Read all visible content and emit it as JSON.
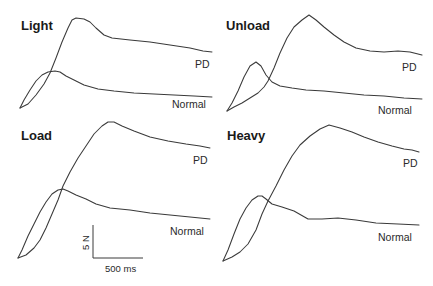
{
  "chart_data": {
    "type": "line",
    "title": "",
    "xlabel": "",
    "ylabel": "",
    "grid": false,
    "legend": "inline labels at the right end of each trace",
    "scale_bar": {
      "vertical_label": "5 N",
      "horizontal_label": "500 ms"
    },
    "panels": [
      {
        "title": "Light",
        "series": [
          {
            "name": "PD",
            "points": [
              [
                20,
                108
              ],
              [
                28,
                104
              ],
              [
                36,
                95
              ],
              [
                44,
                84
              ],
              [
                50,
                73
              ],
              [
                56,
                58
              ],
              [
                62,
                42
              ],
              [
                68,
                28
              ],
              [
                72,
                20
              ],
              [
                76,
                18
              ],
              [
                84,
                19
              ],
              [
                90,
                22
              ],
              [
                96,
                28
              ],
              [
                104,
                35
              ],
              [
                112,
                38
              ],
              [
                130,
                40
              ],
              [
                150,
                42
              ],
              [
                170,
                45
              ],
              [
                190,
                48
              ],
              [
                203,
                51
              ],
              [
                212,
                52
              ]
            ]
          },
          {
            "name": "Normal",
            "points": [
              [
                20,
                108
              ],
              [
                24,
                100
              ],
              [
                30,
                90
              ],
              [
                36,
                81
              ],
              [
                42,
                75
              ],
              [
                48,
                72
              ],
              [
                55,
                71
              ],
              [
                60,
                72
              ],
              [
                66,
                76
              ],
              [
                74,
                80
              ],
              [
                84,
                85
              ],
              [
                98,
                89
              ],
              [
                114,
                91
              ],
              [
                134,
                93
              ],
              [
                154,
                94
              ],
              [
                174,
                95
              ],
              [
                194,
                96
              ],
              [
                212,
                97
              ]
            ]
          }
        ],
        "labels": {
          "pd": "PD",
          "normal": "Normal"
        }
      },
      {
        "title": "Unload",
        "series": [
          {
            "name": "PD",
            "points": [
              [
                227,
                111
              ],
              [
                234,
                107
              ],
              [
                242,
                103
              ],
              [
                250,
                98
              ],
              [
                258,
                93
              ],
              [
                264,
                87
              ],
              [
                268,
                81
              ],
              [
                274,
                68
              ],
              [
                280,
                53
              ],
              [
                287,
                38
              ],
              [
                294,
                27
              ],
              [
                302,
                20
              ],
              [
                309,
                15
              ],
              [
                316,
                20
              ],
              [
                324,
                27
              ],
              [
                334,
                35
              ],
              [
                344,
                42
              ],
              [
                356,
                48
              ],
              [
                370,
                51
              ],
              [
                384,
                52
              ],
              [
                398,
                51
              ],
              [
                410,
                52
              ],
              [
                422,
                55
              ]
            ]
          },
          {
            "name": "Normal",
            "points": [
              [
                227,
                111
              ],
              [
                232,
                103
              ],
              [
                238,
                91
              ],
              [
                244,
                77
              ],
              [
                250,
                66
              ],
              [
                256,
                62
              ],
              [
                261,
                66
              ],
              [
                266,
                75
              ],
              [
                272,
                82
              ],
              [
                280,
                86
              ],
              [
                292,
                88
              ],
              [
                306,
                90
              ],
              [
                324,
                91
              ],
              [
                344,
                93
              ],
              [
                364,
                95
              ],
              [
                384,
                96
              ],
              [
                404,
                98
              ],
              [
                422,
                99
              ]
            ]
          }
        ],
        "labels": {
          "pd": "PD",
          "normal": "Normal"
        }
      },
      {
        "title": "Load",
        "series": [
          {
            "name": "PD",
            "points": [
              [
                18,
                258
              ],
              [
                26,
                255
              ],
              [
                34,
                248
              ],
              [
                40,
                240
              ],
              [
                46,
                228
              ],
              [
                52,
                214
              ],
              [
                58,
                200
              ],
              [
                63,
                186
              ],
              [
                70,
                172
              ],
              [
                78,
                158
              ],
              [
                86,
                146
              ],
              [
                94,
                134
              ],
              [
                102,
                126
              ],
              [
                108,
                122
              ],
              [
                114,
                122
              ],
              [
                122,
                126
              ],
              [
                134,
                131
              ],
              [
                150,
                137
              ],
              [
                168,
                141
              ],
              [
                186,
                144
              ],
              [
                200,
                146
              ],
              [
                210,
                148
              ]
            ]
          },
          {
            "name": "Normal",
            "points": [
              [
                18,
                258
              ],
              [
                22,
                250
              ],
              [
                28,
                236
              ],
              [
                34,
                224
              ],
              [
                40,
                212
              ],
              [
                46,
                202
              ],
              [
                52,
                194
              ],
              [
                58,
                190
              ],
              [
                63,
                189
              ],
              [
                68,
                191
              ],
              [
                76,
                195
              ],
              [
                86,
                199
              ],
              [
                96,
                204
              ],
              [
                110,
                208
              ],
              [
                130,
                210
              ],
              [
                150,
                213
              ],
              [
                170,
                215
              ],
              [
                190,
                217
              ],
              [
                210,
                219
              ]
            ]
          }
        ],
        "labels": {
          "pd": "PD",
          "normal": "Normal"
        }
      },
      {
        "title": "Heavy",
        "series": [
          {
            "name": "PD",
            "points": [
              [
                223,
                261
              ],
              [
                232,
                257
              ],
              [
                240,
                252
              ],
              [
                248,
                244
              ],
              [
                256,
                230
              ],
              [
                262,
                214
              ],
              [
                268,
                201
              ],
              [
                276,
                186
              ],
              [
                284,
                170
              ],
              [
                292,
                156
              ],
              [
                300,
                145
              ],
              [
                310,
                136
              ],
              [
                320,
                129
              ],
              [
                329,
                125
              ],
              [
                340,
                128
              ],
              [
                352,
                132
              ],
              [
                364,
                137
              ],
              [
                378,
                142
              ],
              [
                392,
                146
              ],
              [
                404,
                149
              ],
              [
                412,
                150
              ],
              [
                419,
                152
              ]
            ]
          },
          {
            "name": "Normal",
            "points": [
              [
                223,
                261
              ],
              [
                228,
                250
              ],
              [
                234,
                234
              ],
              [
                240,
                219
              ],
              [
                246,
                208
              ],
              [
                252,
                200
              ],
              [
                258,
                196
              ],
              [
                262,
                196
              ],
              [
                266,
                199
              ],
              [
                272,
                204
              ],
              [
                282,
                207
              ],
              [
                294,
                211
              ],
              [
                308,
                219
              ],
              [
                322,
                219
              ],
              [
                338,
                218
              ],
              [
                356,
                220
              ],
              [
                376,
                223
              ],
              [
                398,
                224
              ],
              [
                419,
                225
              ]
            ]
          }
        ],
        "labels": {
          "pd": "PD",
          "normal": "Normal"
        }
      }
    ]
  },
  "figure": {
    "panels": [
      {
        "title": "Light",
        "pd_label": "PD",
        "normal_label": "Normal"
      },
      {
        "title": "Unload",
        "pd_label": "PD",
        "normal_label": "Normal"
      },
      {
        "title": "Load",
        "pd_label": "PD",
        "normal_label": "Normal"
      },
      {
        "title": "Heavy",
        "pd_label": "PD",
        "normal_label": "Normal"
      }
    ],
    "scale_bar": {
      "force": "5 N",
      "time": "500 ms"
    }
  },
  "colors": {
    "trace": "#3a3a3a",
    "text": "#1a1a1a",
    "background": "#ffffff"
  }
}
